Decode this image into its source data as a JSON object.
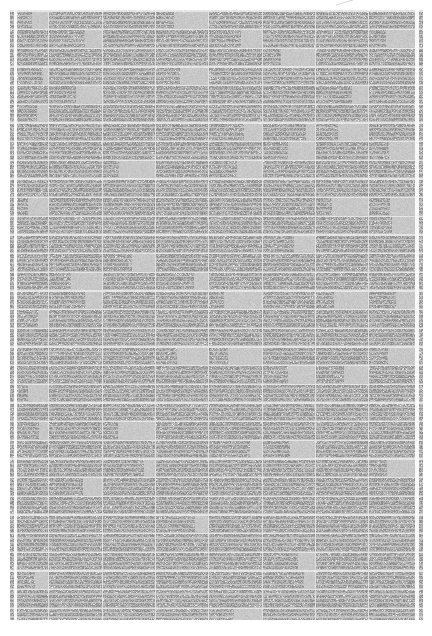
{
  "window": {
    "width": 432,
    "height": 636,
    "background": "#ffffff"
  },
  "document_thumbnail": {
    "description": "zoomed-out page of dense unreadable micro-text arranged as a table grid",
    "block": {
      "left": 10,
      "top": 10,
      "right": 423,
      "bottom": 620
    },
    "left_gutter": {
      "from": 10,
      "to": 14
    },
    "left_gap": {
      "from": 14,
      "to": 17
    },
    "main": {
      "from": 17,
      "to": 415
    },
    "right_separator": {
      "from": 415,
      "to": 419
    },
    "right_gutter": {
      "from": 419,
      "to": 423
    },
    "row_pitch": 18.66,
    "row_separator_height": 1.3,
    "text_line_pitch": 4.36,
    "text_line_gap": 1.15,
    "lines_per_row": 4,
    "column_lines": [
      48,
      102,
      155,
      208,
      262,
      315,
      368
    ],
    "colors": {
      "page_background": "#ffffff",
      "text_noise_base": "#a6a6a6",
      "text_noise_amplitude": 60,
      "speckle_boost": 45,
      "speckle_probability": 0.07,
      "line_gap": "#c6c6c6",
      "line_gap_amplitude": 22,
      "row_separator": "#e6e6e6",
      "row_separator_amplitude": 14,
      "column_line": "#e1e1e1",
      "margin_separator": "#f4f4f4",
      "blank_cell": "#c8c8c8",
      "blank_cell_amplitude": 16
    },
    "mark": {
      "x1": 336,
      "y1": 5,
      "x2": 353,
      "y2": 0,
      "color": "#bdbdbd",
      "opacity": 0.6
    },
    "seed": 1234,
    "short_cell_probability": 0.18
  }
}
